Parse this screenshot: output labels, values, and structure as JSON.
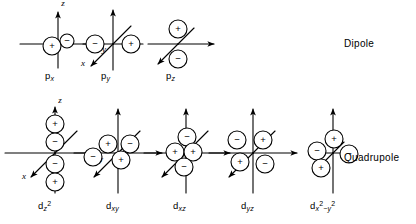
{
  "figure": {
    "background_color": "#ffffff",
    "stroke_color": "#000000",
    "width": 416,
    "height": 224
  },
  "rows": [
    {
      "id": "dipole-row",
      "row_label": "Dipole",
      "row_label_x": 344,
      "row_label_y": 38,
      "orbitals": [
        {
          "id": "p-x",
          "label_html": "p<sub>x</sub>",
          "label_text": "px",
          "origin_x": 58,
          "origin_y": 44,
          "label_x": 45,
          "label_y": 70,
          "axes": [
            {
              "name": "z-axis",
              "letter": "z",
              "dx": 0,
              "dy": -32,
              "letter_dx": 5,
              "letter_dy": -38,
              "arrow": true
            },
            {
              "name": "y-axis",
              "letter": "y",
              "dx": 42,
              "dy": 0,
              "letter_dx": 46,
              "letter_dy": 8,
              "arrow": true
            },
            {
              "name": "z-axis-negative",
              "letter": "",
              "dx": 0,
              "dy": 24,
              "letter_dx": 0,
              "letter_dy": 0,
              "arrow": false
            },
            {
              "name": "y-axis-negative",
              "letter": "",
              "dx": -38,
              "dy": 0,
              "letter_dx": 0,
              "letter_dy": 0,
              "arrow": false
            }
          ],
          "lobes": [
            {
              "sign": "+",
              "cx": -6,
              "cy": 2,
              "r": 9
            },
            {
              "sign": "−",
              "cx": 9,
              "cy": -3,
              "r": 7
            }
          ]
        },
        {
          "id": "p-y",
          "label_html": "p<sub>y</sub>",
          "label_text": "py",
          "origin_x": 113,
          "origin_y": 44,
          "label_x": 101,
          "label_y": 70,
          "axes": [
            {
              "name": "z-axis",
              "letter": "",
              "dx": 0,
              "dy": -34,
              "letter_dx": 0,
              "letter_dy": 0,
              "arrow": true
            },
            {
              "name": "y-axis",
              "letter": "",
              "dx": 30,
              "dy": 0,
              "letter_dx": 0,
              "letter_dy": 0,
              "arrow": false
            },
            {
              "name": "z-axis-negative",
              "letter": "",
              "dx": 0,
              "dy": 26,
              "letter_dx": 0,
              "letter_dy": 0,
              "arrow": false
            },
            {
              "name": "y-axis-negative",
              "letter": "",
              "dx": -30,
              "dy": 0,
              "letter_dx": 0,
              "letter_dy": 0,
              "arrow": false
            },
            {
              "name": "x-axis",
              "letter": "x",
              "dx": -22,
              "dy": 22,
              "letter_dx": -30,
              "letter_dy": 22,
              "arrow": true
            },
            {
              "name": "x-axis-negative",
              "letter": "",
              "dx": 18,
              "dy": -18,
              "letter_dx": 0,
              "letter_dy": 0,
              "arrow": false
            }
          ],
          "lobes": [
            {
              "sign": "−",
              "cx": -18,
              "cy": 0,
              "r": 9
            },
            {
              "sign": "+",
              "cx": 18,
              "cy": 0,
              "r": 9
            }
          ]
        },
        {
          "id": "p-z",
          "label_html": "p<sub>z</sub>",
          "label_text": "pz",
          "origin_x": 178,
          "origin_y": 44,
          "label_x": 166,
          "label_y": 70,
          "axes": [
            {
              "name": "y-axis",
              "letter": "",
              "dx": 36,
              "dy": 0,
              "letter_dx": 0,
              "letter_dy": 0,
              "arrow": true
            },
            {
              "name": "y-axis-negative",
              "letter": "",
              "dx": -30,
              "dy": 0,
              "letter_dx": 0,
              "letter_dy": 0,
              "arrow": false
            },
            {
              "name": "x-axis",
              "letter": "",
              "dx": -20,
              "dy": 20,
              "letter_dx": 0,
              "letter_dy": 0,
              "arrow": true
            },
            {
              "name": "x-axis-negative",
              "letter": "",
              "dx": 16,
              "dy": -16,
              "letter_dx": 0,
              "letter_dy": 0,
              "arrow": false
            }
          ],
          "lobes": [
            {
              "sign": "+",
              "cx": 0,
              "cy": -15,
              "r": 9
            },
            {
              "sign": "−",
              "cx": 0,
              "cy": 15,
              "r": 9
            }
          ]
        }
      ]
    },
    {
      "id": "quadrupole-row",
      "row_label": "Quadrupole",
      "row_label_x": 344,
      "row_label_y": 152,
      "orbitals": [
        {
          "id": "d-z2",
          "label_html": "d<sub>z</sub><sup>2</sup>",
          "label_text": "dz2",
          "origin_x": 55,
          "origin_y": 153,
          "label_x": 38,
          "label_y": 200,
          "axes": [
            {
              "name": "z-axis",
              "letter": "z",
              "dx": 0,
              "dy": -46,
              "letter_dx": 5,
              "letter_dy": -50,
              "arrow": true
            },
            {
              "name": "y-axis",
              "letter": "y",
              "dx": 42,
              "dy": 0,
              "letter_dx": 46,
              "letter_dy": 9,
              "arrow": true
            },
            {
              "name": "z-axis-negative",
              "letter": "",
              "dx": 0,
              "dy": 40,
              "letter_dx": 0,
              "letter_dy": 0,
              "arrow": false
            },
            {
              "name": "y-axis-negative",
              "letter": "",
              "dx": -50,
              "dy": 0,
              "letter_dx": 0,
              "letter_dy": 0,
              "arrow": false
            },
            {
              "name": "x-axis",
              "letter": "x",
              "dx": -24,
              "dy": 24,
              "letter_dx": -31,
              "letter_dy": 26,
              "arrow": true
            },
            {
              "name": "x-axis-negative",
              "letter": "",
              "dx": 22,
              "dy": -22,
              "letter_dx": 0,
              "letter_dy": 0,
              "arrow": false
            }
          ],
          "lobes": [
            {
              "sign": "+",
              "cx": 0,
              "cy": -29,
              "r": 9
            },
            {
              "sign": "−",
              "cx": 0,
              "cy": -11,
              "r": 9
            },
            {
              "sign": "−",
              "cx": 0,
              "cy": 11,
              "r": 9
            },
            {
              "sign": "+",
              "cx": 0,
              "cy": 29,
              "r": 9
            }
          ]
        },
        {
          "id": "d-xy",
          "label_html": "d<sub>xy</sub>",
          "label_text": "dxy",
          "origin_x": 118,
          "origin_y": 153,
          "label_x": 106,
          "label_y": 200,
          "axes": [
            {
              "name": "z-axis",
              "letter": "",
              "dx": 0,
              "dy": -44,
              "letter_dx": 0,
              "letter_dy": 0,
              "arrow": true
            },
            {
              "name": "y-axis",
              "letter": "",
              "dx": 44,
              "dy": 0,
              "letter_dx": 0,
              "letter_dy": 0,
              "arrow": true
            },
            {
              "name": "z-axis-negative",
              "letter": "",
              "dx": 0,
              "dy": 40,
              "letter_dx": 0,
              "letter_dy": 0,
              "arrow": false
            },
            {
              "name": "y-axis-negative",
              "letter": "",
              "dx": -44,
              "dy": 0,
              "letter_dx": 0,
              "letter_dy": 0,
              "arrow": false
            },
            {
              "name": "x-axis",
              "letter": "",
              "dx": -24,
              "dy": 24,
              "letter_dx": 0,
              "letter_dy": 0,
              "arrow": true
            },
            {
              "name": "x-axis-negative",
              "letter": "",
              "dx": 22,
              "dy": -22,
              "letter_dx": 0,
              "letter_dy": 0,
              "arrow": false
            }
          ],
          "lobes": [
            {
              "sign": "+",
              "cx": -10,
              "cy": -9,
              "r": 9
            },
            {
              "sign": "−",
              "cx": 12,
              "cy": -9,
              "r": 9
            },
            {
              "sign": "−",
              "cx": -25,
              "cy": 4,
              "r": 9
            },
            {
              "sign": "+",
              "cx": 3,
              "cy": 7,
              "r": 9
            }
          ]
        },
        {
          "id": "d-xz",
          "label_html": "d<sub>xz</sub>",
          "label_text": "dxz",
          "origin_x": 186,
          "origin_y": 153,
          "label_x": 173,
          "label_y": 200,
          "axes": [
            {
              "name": "z-axis",
              "letter": "",
              "dx": 0,
              "dy": -44,
              "letter_dx": 0,
              "letter_dy": 0,
              "arrow": true
            },
            {
              "name": "y-axis",
              "letter": "",
              "dx": 44,
              "dy": 0,
              "letter_dx": 0,
              "letter_dy": 0,
              "arrow": true
            },
            {
              "name": "z-axis-negative",
              "letter": "",
              "dx": 0,
              "dy": 40,
              "letter_dx": 0,
              "letter_dy": 0,
              "arrow": false
            },
            {
              "name": "y-axis-negative",
              "letter": "",
              "dx": -42,
              "dy": 0,
              "letter_dx": 0,
              "letter_dy": 0,
              "arrow": false
            },
            {
              "name": "x-axis",
              "letter": "",
              "dx": -24,
              "dy": 24,
              "letter_dx": 0,
              "letter_dy": 0,
              "arrow": true
            },
            {
              "name": "x-axis-negative",
              "letter": "",
              "dx": 22,
              "dy": -22,
              "letter_dx": 0,
              "letter_dy": 0,
              "arrow": false
            }
          ],
          "lobes": [
            {
              "sign": "−",
              "cx": 1,
              "cy": -16,
              "r": 9
            },
            {
              "sign": "+",
              "cx": -11,
              "cy": -1,
              "r": 9
            },
            {
              "sign": "+",
              "cx": 7,
              "cy": -1,
              "r": 9
            },
            {
              "sign": "−",
              "cx": -2,
              "cy": 14,
              "r": 9
            }
          ]
        },
        {
          "id": "d-yz",
          "label_html": "d<sub>yz</sub>",
          "label_text": "dyz",
          "origin_x": 253,
          "origin_y": 153,
          "label_x": 241,
          "label_y": 200,
          "axes": [
            {
              "name": "z-axis",
              "letter": "",
              "dx": 0,
              "dy": -44,
              "letter_dx": 0,
              "letter_dy": 0,
              "arrow": true
            },
            {
              "name": "y-axis",
              "letter": "",
              "dx": 44,
              "dy": 0,
              "letter_dx": 0,
              "letter_dy": 0,
              "arrow": true
            },
            {
              "name": "z-axis-negative",
              "letter": "",
              "dx": 0,
              "dy": 40,
              "letter_dx": 0,
              "letter_dy": 0,
              "arrow": false
            },
            {
              "name": "y-axis-negative",
              "letter": "",
              "dx": -44,
              "dy": 0,
              "letter_dx": 0,
              "letter_dy": 0,
              "arrow": false
            },
            {
              "name": "x-axis",
              "letter": "",
              "dx": -24,
              "dy": 24,
              "letter_dx": 0,
              "letter_dy": 0,
              "arrow": true
            },
            {
              "name": "x-axis-negative",
              "letter": "",
              "dx": 22,
              "dy": -22,
              "letter_dx": 0,
              "letter_dy": 0,
              "arrow": false
            }
          ],
          "lobes": [
            {
              "sign": "−",
              "cx": -16,
              "cy": -13,
              "r": 9
            },
            {
              "sign": "+",
              "cx": 10,
              "cy": -13,
              "r": 9
            },
            {
              "sign": "+",
              "cx": -13,
              "cy": 9,
              "r": 9
            },
            {
              "sign": "−",
              "cx": 12,
              "cy": 11,
              "r": 9
            }
          ]
        },
        {
          "id": "d-x2-y2",
          "label_html": "d<sub>x</sub><sup>2</sup><sub>−y</sub><sup>2</sup>",
          "label_text": "dx2-y2",
          "origin_x": 333,
          "origin_y": 153,
          "label_x": 310,
          "label_y": 200,
          "axes": [
            {
              "name": "z-axis",
              "letter": "",
              "dx": 0,
              "dy": -44,
              "letter_dx": 0,
              "letter_dy": 0,
              "arrow": true
            },
            {
              "name": "z-axis-negative",
              "letter": "",
              "dx": 0,
              "dy": 40,
              "letter_dx": 0,
              "letter_dy": 0,
              "arrow": false
            },
            {
              "name": "y-axis",
              "letter": "",
              "dx": 16,
              "dy": 0,
              "letter_dx": 0,
              "letter_dy": 0,
              "arrow": false
            },
            {
              "name": "y-axis-negative",
              "letter": "",
              "dx": -16,
              "dy": 0,
              "letter_dx": 0,
              "letter_dy": 0,
              "arrow": false
            },
            {
              "name": "x-axis",
              "letter": "",
              "dx": -12,
              "dy": 12,
              "letter_dx": 0,
              "letter_dy": 0,
              "arrow": false
            },
            {
              "name": "x-axis-negative",
              "letter": "",
              "dx": 11,
              "dy": -11,
              "letter_dx": 0,
              "letter_dy": 0,
              "arrow": false
            }
          ],
          "lobes": [
            {
              "sign": "+",
              "cx": 1,
              "cy": -14,
              "r": 9
            },
            {
              "sign": "−",
              "cx": -16,
              "cy": -2,
              "r": 9
            },
            {
              "sign": "−",
              "cx": 16,
              "cy": 1,
              "r": 9
            },
            {
              "sign": "+",
              "cx": -12,
              "cy": 15,
              "r": 9
            }
          ]
        }
      ]
    }
  ]
}
